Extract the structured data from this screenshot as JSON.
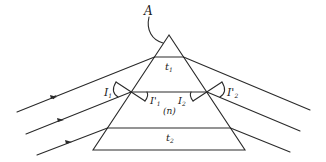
{
  "diagram": {
    "labels": {
      "apex": "A",
      "t1": "t",
      "t1_sub": "1",
      "t2": "t",
      "t2_sub": "2",
      "medium": "(n)",
      "i1": "I",
      "i1_sub": "1",
      "r1": "I'",
      "r1_sub": "1",
      "i2": "I",
      "i2_sub": "2",
      "r2": "I'",
      "r2_sub": "2"
    },
    "colors": {
      "stroke": "#2a2a2a",
      "background": "#ffffff"
    },
    "prism": {
      "apex": [
        169,
        35
      ],
      "base_left": [
        93,
        150
      ],
      "base_right": [
        245,
        150
      ]
    },
    "rays": [
      {
        "name": "top-ray",
        "start": [
          17,
          112
        ],
        "entry": [
          154.5,
          57
        ],
        "exit": [
          183.5,
          57
        ],
        "end": [
          310,
          110
        ]
      },
      {
        "name": "middle-ray",
        "start": [
          26,
          134
        ],
        "entry": [
          131,
          92
        ],
        "exit": [
          207,
          92
        ],
        "end": [
          300,
          131
        ]
      },
      {
        "name": "bottom-ray",
        "start": [
          37,
          155
        ],
        "entry": [
          107.5,
          128
        ],
        "exit": [
          230.5,
          128
        ],
        "end": [
          290,
          152
        ]
      }
    ]
  }
}
